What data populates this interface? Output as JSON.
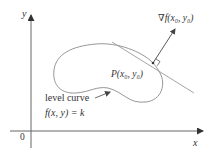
{
  "diagram": {
    "axes": {
      "x_label": "x",
      "y_label": "y",
      "origin_label": "0"
    },
    "point_label": "P(x₀, y₀)",
    "gradient_label": "∇f(x₀, y₀)",
    "level_curve_label": "level curve",
    "level_curve_equation": "f(x, y) = k",
    "colors": {
      "axis": "#555555",
      "curve": "#8a8a8a",
      "tangent": "#9a9a9a",
      "arrow": "#444444",
      "text": "#333333"
    }
  }
}
